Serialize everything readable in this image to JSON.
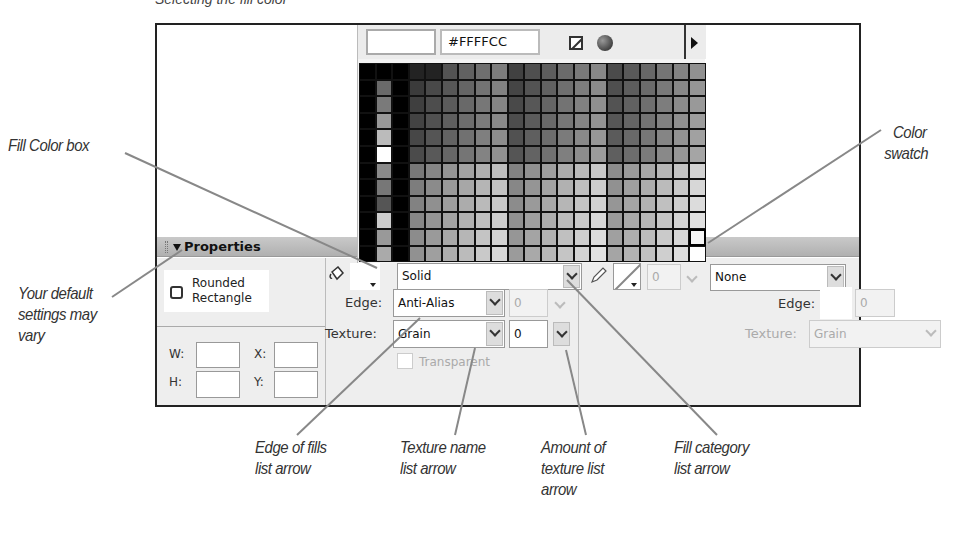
{
  "caption": "Selecting the fill color",
  "palette": {
    "hex_value": "#FFFFCC",
    "no_color_icon": "no-color-icon",
    "color_picker_icon": "globe-icon",
    "menu_icon": "triangle-right-icon",
    "rows": 12,
    "selected_swatch": {
      "row": 10,
      "col": 20
    }
  },
  "properties": {
    "title": "Properties",
    "tool_name_line1": "Rounded",
    "tool_name_line2": "Rectangle",
    "w_label": "W:",
    "h_label": "H:",
    "x_label": "X:",
    "y_label": "Y:",
    "fill": {
      "category": "Solid",
      "edge_label": "Edge:",
      "edge_value": "Anti-Alias",
      "edge_amount": "0",
      "texture_label": "Texture:",
      "texture_value": "Grain",
      "texture_amount": "0",
      "transparent_label": "Transparent"
    },
    "stroke": {
      "width_value": "0",
      "category": "None",
      "edge_label": "Edge:",
      "edge_amount": "0",
      "texture_label": "Texture:",
      "texture_value": "Grain",
      "texture_amount": "0"
    }
  },
  "callouts": {
    "fill_color_box": "Fill Color box",
    "color_swatch_1": "Color",
    "color_swatch_2": "swatch",
    "default_settings_1": "Your default",
    "default_settings_2": "settings may",
    "default_settings_3": "vary",
    "edge_fills_1": "Edge of fills",
    "edge_fills_2": "list arrow",
    "texture_name_1": "Texture name",
    "texture_name_2": "list arrow",
    "texture_amount_1": "Amount of",
    "texture_amount_2": "texture list",
    "texture_amount_3": "arrow",
    "fill_category_1": "Fill category",
    "fill_category_2": "list arrow"
  }
}
